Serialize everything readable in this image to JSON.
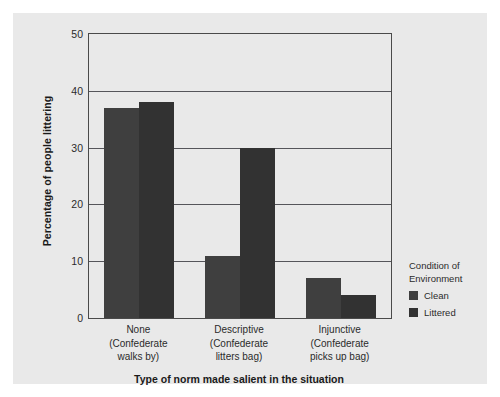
{
  "chart_data": {
    "type": "bar",
    "title": "",
    "xlabel": "Type of norm made salient in the situation",
    "ylabel": "Percentage of people littering",
    "categories": [
      "None\n(Confederate walks by)",
      "Descriptive\n(Confederate litters bag)",
      "Injunctive\n(Confederate picks up bag)"
    ],
    "series": [
      {
        "name": "Clean",
        "values": [
          37,
          11,
          7
        ]
      },
      {
        "name": "Littered",
        "values": [
          38,
          30,
          4
        ]
      }
    ],
    "ylim": [
      0,
      50
    ],
    "yticks": [
      0,
      10,
      20,
      30,
      40,
      50
    ],
    "grid": true,
    "legend_position": "right"
  },
  "axes": {
    "y_title": "Percentage of people littering",
    "x_title": "Type of norm made salient in the situation",
    "y_tick_labels": [
      "0",
      "10",
      "20",
      "30",
      "40",
      "50"
    ]
  },
  "x_groups": [
    {
      "main": "None",
      "sub_line1": "(Confederate",
      "sub_line2": "walks by)"
    },
    {
      "main": "Descriptive",
      "sub_line1": "(Confederate",
      "sub_line2": "litters bag)"
    },
    {
      "main": "Injunctive",
      "sub_line1": "(Confederate",
      "sub_line2": "picks up bag)"
    }
  ],
  "legend": {
    "title_line1": "Condition of",
    "title_line2": "Environment",
    "items": [
      {
        "label": "Clean",
        "color": "#3f3f3f"
      },
      {
        "label": "Littered",
        "color": "#323232"
      }
    ]
  },
  "colors": {
    "figure_background": "#e9e9e9",
    "page_background": "#ffffff",
    "axis_line": "#4a4a4a",
    "gridline": "#55555a",
    "clean_bar": "#3f3f3f",
    "littered_bar": "#323232",
    "text": "#2b2b2b"
  }
}
